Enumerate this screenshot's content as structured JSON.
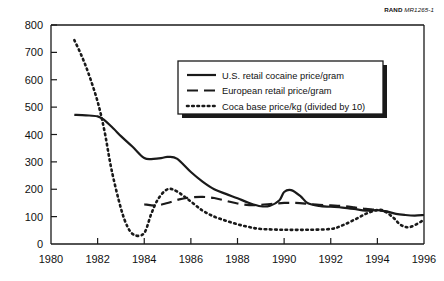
{
  "figure": {
    "source_note_bold": "RAND",
    "source_note_italic": "MR1265-1"
  },
  "chart_data": {
    "type": "line",
    "title": "",
    "subtitle": "",
    "xlabel": "",
    "ylabel": "",
    "xlim": [
      1980,
      1996
    ],
    "ylim": [
      0,
      800
    ],
    "xticks": [
      1980,
      1982,
      1984,
      1986,
      1988,
      1990,
      1992,
      1994,
      1996
    ],
    "xtick_labels": [
      "1980",
      "1982",
      "1984",
      "1986",
      "1988",
      "1990",
      "1992",
      "1994",
      "1996"
    ],
    "yticks": [
      0,
      100,
      200,
      300,
      400,
      500,
      600,
      700,
      800
    ],
    "ytick_labels": [
      "0",
      "100",
      "200",
      "300",
      "400",
      "500",
      "600",
      "700",
      "800"
    ],
    "grid": false,
    "legend_position": "upper-center-right",
    "series": [
      {
        "name": "U.S. retail cocaine price/gram",
        "style": "solid",
        "color": "#1a1a1a",
        "x": [
          1981.0,
          1981.5,
          1982.0,
          1982.3,
          1982.7,
          1983.0,
          1983.5,
          1984.0,
          1984.4,
          1984.8,
          1985.0,
          1985.4,
          1986.0,
          1986.5,
          1987.0,
          1987.5,
          1988.0,
          1988.5,
          1989.0,
          1989.4,
          1989.8,
          1990.0,
          1990.3,
          1990.7,
          1991.0,
          1991.5,
          1992.0,
          1992.5,
          1993.0,
          1993.5,
          1994.0,
          1994.4,
          1994.8,
          1995.2,
          1995.6,
          1996.0
        ],
        "y": [
          472,
          470,
          466,
          452,
          420,
          394,
          355,
          314,
          311,
          315,
          318,
          312,
          263,
          228,
          200,
          183,
          167,
          150,
          138,
          140,
          160,
          190,
          197,
          175,
          150,
          139,
          136,
          133,
          128,
          122,
          124,
          119,
          110,
          106,
          104,
          106
        ]
      },
      {
        "name": "European retail price/gram",
        "style": "dashed",
        "color": "#1a1a1a",
        "x": [
          1984.0,
          1984.5,
          1985.0,
          1985.5,
          1986.0,
          1986.5,
          1987.0,
          1987.5,
          1988.0,
          1988.5,
          1989.0,
          1989.5,
          1990.0,
          1990.5,
          1991.0,
          1991.5,
          1992.0,
          1992.5,
          1993.0,
          1993.5,
          1994.0,
          1994.5
        ],
        "y": [
          145,
          140,
          150,
          163,
          170,
          172,
          168,
          158,
          148,
          142,
          143,
          147,
          150,
          150,
          147,
          143,
          141,
          139,
          134,
          128,
          124,
          116
        ]
      },
      {
        "name": "Coca base price/kg (divided by 10)",
        "style": "dotted",
        "color": "#1a1a1a",
        "x": [
          1981.0,
          1981.3,
          1981.6,
          1982.0,
          1982.3,
          1982.6,
          1983.0,
          1983.3,
          1983.6,
          1984.0,
          1984.3,
          1984.6,
          1985.0,
          1985.4,
          1986.0,
          1986.5,
          1987.0,
          1987.5,
          1988.0,
          1988.5,
          1989.0,
          1990.0,
          1991.0,
          1992.0,
          1992.5,
          1993.0,
          1993.5,
          1994.0,
          1994.3,
          1994.7,
          1995.0,
          1995.4,
          1996.0
        ],
        "y": [
          745,
          690,
          625,
          520,
          410,
          270,
          130,
          60,
          32,
          40,
          110,
          165,
          200,
          192,
          155,
          122,
          100,
          85,
          72,
          62,
          55,
          52,
          52,
          55,
          68,
          88,
          110,
          124,
          120,
          95,
          70,
          62,
          88
        ]
      }
    ],
    "annotations": []
  },
  "legend": {
    "items": [
      {
        "label": "U.S. retail cocaine price/gram",
        "style": "solid"
      },
      {
        "label": "European retail price/gram",
        "style": "dashed"
      },
      {
        "label": "Coca base price/kg (divided by 10)",
        "style": "dotted"
      }
    ]
  }
}
